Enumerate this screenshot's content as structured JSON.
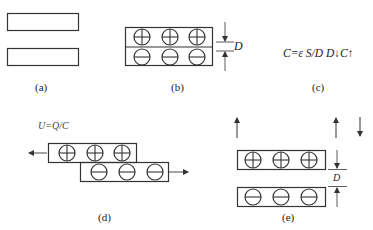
{
  "panels": {
    "a": {
      "label": "(a)"
    },
    "b": {
      "label": "(b)",
      "dimension": "D"
    },
    "c": {
      "label": "(c)",
      "formula": "C=ε S/D  D↓C↑"
    },
    "d": {
      "label": "(d)",
      "formula": "U=Q/C"
    },
    "e": {
      "label": "(e)",
      "dimension": "D"
    }
  },
  "symbols": {
    "positive": "⊕",
    "negative": "⊖"
  },
  "colors": {
    "stroke": "#333333",
    "background": "#ffffff"
  }
}
